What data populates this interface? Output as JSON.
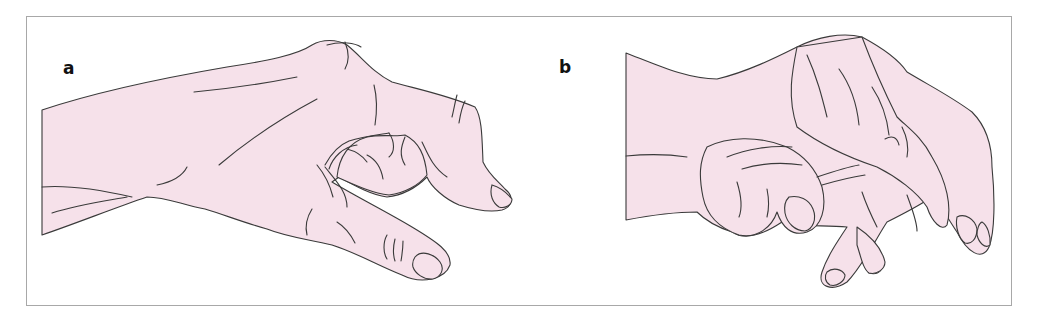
{
  "figure": {
    "panels": [
      {
        "id": "a",
        "label": "a",
        "subject": "hand-lateral-view-claw-thumb"
      },
      {
        "id": "b",
        "label": "b",
        "subject": "hand-flexed-fingers-view"
      }
    ],
    "colors": {
      "skin_fill": "#f6e1ea",
      "outline": "#3a3a3a",
      "frame_border": "#a8a8a8",
      "background": "#ffffff",
      "label": "#111111"
    }
  }
}
